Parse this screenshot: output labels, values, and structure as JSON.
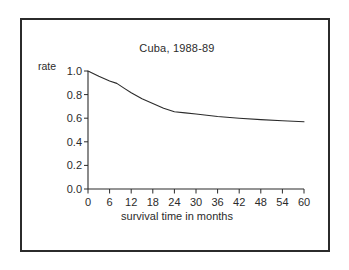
{
  "figure": {
    "frame_border_color": "#2b2b2b",
    "background": "#ffffff"
  },
  "chart_data": {
    "type": "line",
    "title": "Cuba, 1988-89",
    "xlabel": "survival time in months",
    "ylabel": "rate",
    "xlim": [
      0,
      60
    ],
    "ylim": [
      0.0,
      1.0
    ],
    "grid": false,
    "legend": null,
    "x_ticks": [
      0,
      6,
      12,
      18,
      24,
      30,
      36,
      42,
      48,
      54,
      60
    ],
    "x_tick_labels": [
      "0",
      "6",
      "12",
      "18",
      "24",
      "30",
      "36",
      "42",
      "48",
      "54",
      "60"
    ],
    "y_ticks": [
      0.0,
      0.2,
      0.4,
      0.6,
      0.8,
      1.0
    ],
    "y_tick_labels": [
      "0.0",
      "0.2",
      "0.4",
      "0.6",
      "0.8",
      "1.0"
    ],
    "line_color": "#2b2b2b",
    "series": [
      {
        "name": "survival rate",
        "x": [
          0,
          3,
          6,
          8,
          10,
          12,
          15,
          18,
          21,
          24,
          27,
          30,
          33,
          36,
          42,
          48,
          54,
          60
        ],
        "values": [
          1.0,
          0.955,
          0.915,
          0.895,
          0.855,
          0.815,
          0.765,
          0.725,
          0.685,
          0.655,
          0.645,
          0.635,
          0.625,
          0.615,
          0.6,
          0.588,
          0.578,
          0.57
        ]
      }
    ]
  }
}
